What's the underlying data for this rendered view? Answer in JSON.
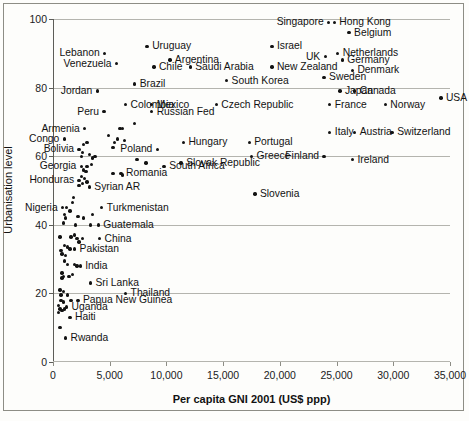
{
  "chart_data": {
    "type": "scatter",
    "title": "",
    "xlabel": "Per capita GNI 2001 (US$ ppp)",
    "ylabel": "Urbanisation level",
    "xlim": [
      0,
      35000
    ],
    "ylim": [
      0,
      100
    ],
    "xticks": [
      0,
      5000,
      10000,
      15000,
      20000,
      25000,
      30000,
      35000
    ],
    "xtick_labels": [
      "0",
      "5,000",
      "10,000",
      "15,000",
      "20,000",
      "25,000",
      "30,000",
      "35,000"
    ],
    "yticks": [
      0,
      20,
      40,
      60,
      80,
      100
    ],
    "ytick_labels": [
      "0",
      "20",
      "40",
      "60",
      "80",
      "100"
    ],
    "grid": "horizontal",
    "legend": "none",
    "marker_color": "#121212",
    "grid_color": "#b4b4ae",
    "labeled_points": [
      {
        "label": "Singapore",
        "x": 24300,
        "y": 99,
        "side": "left"
      },
      {
        "label": "Hong Kong",
        "x": 24800,
        "y": 99,
        "side": "right"
      },
      {
        "label": "Belgium",
        "x": 26100,
        "y": 96,
        "side": "right"
      },
      {
        "label": "Lebanon",
        "x": 4550,
        "y": 90,
        "side": "left"
      },
      {
        "label": "Uruguay",
        "x": 8300,
        "y": 92,
        "side": "right"
      },
      {
        "label": "Israel",
        "x": 19300,
        "y": 92,
        "side": "right"
      },
      {
        "label": "UK",
        "x": 24000,
        "y": 89,
        "side": "left"
      },
      {
        "label": "Netherlands",
        "x": 25100,
        "y": 90,
        "side": "right"
      },
      {
        "label": "Venezuela",
        "x": 5600,
        "y": 87,
        "side": "left"
      },
      {
        "label": "Chile",
        "x": 8900,
        "y": 86,
        "side": "right"
      },
      {
        "label": "Argentina",
        "x": 10300,
        "y": 88,
        "side": "right"
      },
      {
        "label": "Germany",
        "x": 25500,
        "y": 88,
        "side": "right"
      },
      {
        "label": "New Zealand",
        "x": 19300,
        "y": 86,
        "side": "right"
      },
      {
        "label": "Denmark",
        "x": 26400,
        "y": 85,
        "side": "right"
      },
      {
        "label": "Saudi Arabia",
        "x": 12100,
        "y": 86,
        "side": "right"
      },
      {
        "label": "South Korea",
        "x": 15300,
        "y": 82,
        "side": "right"
      },
      {
        "label": "Sweden",
        "x": 23900,
        "y": 83,
        "side": "right"
      },
      {
        "label": "Brazil",
        "x": 7200,
        "y": 81,
        "side": "right"
      },
      {
        "label": "Jordan",
        "x": 3900,
        "y": 79,
        "side": "left"
      },
      {
        "label": "Japan",
        "x": 25300,
        "y": 79,
        "side": "right"
      },
      {
        "label": "Canada",
        "x": 26600,
        "y": 79,
        "side": "right"
      },
      {
        "label": "USA",
        "x": 34200,
        "y": 77,
        "side": "right"
      },
      {
        "label": "Colombia",
        "x": 6400,
        "y": 75,
        "side": "right"
      },
      {
        "label": "Mexico",
        "x": 8700,
        "y": 75,
        "side": "right"
      },
      {
        "label": "Czech Republic",
        "x": 14400,
        "y": 75,
        "side": "right"
      },
      {
        "label": "France",
        "x": 24400,
        "y": 75,
        "side": "right"
      },
      {
        "label": "Norway",
        "x": 29300,
        "y": 75,
        "side": "right"
      },
      {
        "label": "Peru",
        "x": 4500,
        "y": 73,
        "side": "left"
      },
      {
        "label": "Russian Fed",
        "x": 8700,
        "y": 73,
        "side": "right"
      },
      {
        "label": "Armenia",
        "x": 2800,
        "y": 68,
        "side": "left"
      },
      {
        "label": "Italy",
        "x": 24400,
        "y": 67,
        "side": "right"
      },
      {
        "label": "Austria",
        "x": 26600,
        "y": 67,
        "side": "right"
      },
      {
        "label": "Switzerland",
        "x": 29900,
        "y": 67,
        "side": "right"
      },
      {
        "label": "Congo",
        "x": 1000,
        "y": 65,
        "side": "left"
      },
      {
        "label": "Poland",
        "x": 9200,
        "y": 62,
        "side": "left"
      },
      {
        "label": "Hungary",
        "x": 11500,
        "y": 64,
        "side": "right"
      },
      {
        "label": "Portugal",
        "x": 17300,
        "y": 64,
        "side": "right"
      },
      {
        "label": "Bolivia",
        "x": 2300,
        "y": 62,
        "side": "left"
      },
      {
        "label": "Greece",
        "x": 17500,
        "y": 60,
        "side": "right"
      },
      {
        "label": "Finland",
        "x": 23900,
        "y": 60,
        "side": "left"
      },
      {
        "label": "Ireland",
        "x": 26400,
        "y": 59,
        "side": "right"
      },
      {
        "label": "Georgia",
        "x": 2500,
        "y": 57,
        "side": "left"
      },
      {
        "label": "Slovak Republic",
        "x": 11300,
        "y": 58,
        "side": "right"
      },
      {
        "label": "South Africa",
        "x": 9800,
        "y": 57,
        "side": "right"
      },
      {
        "label": "Romania",
        "x": 6000,
        "y": 55,
        "side": "right"
      },
      {
        "label": "Honduras",
        "x": 2300,
        "y": 53,
        "side": "left"
      },
      {
        "label": "Syrian AR",
        "x": 3200,
        "y": 51,
        "side": "right"
      },
      {
        "label": "Slovenia",
        "x": 17800,
        "y": 49,
        "side": "right"
      },
      {
        "label": "Nigeria",
        "x": 850,
        "y": 45,
        "side": "left"
      },
      {
        "label": "Turkmenistan",
        "x": 4300,
        "y": 45,
        "side": "right"
      },
      {
        "label": "Guatemala",
        "x": 4000,
        "y": 40,
        "side": "right"
      },
      {
        "label": "China",
        "x": 4100,
        "y": 36,
        "side": "right"
      },
      {
        "label": "Pakistan",
        "x": 1900,
        "y": 33,
        "side": "right"
      },
      {
        "label": "India",
        "x": 2400,
        "y": 28,
        "side": "right"
      },
      {
        "label": "Sri Lanka",
        "x": 3300,
        "y": 23,
        "side": "right"
      },
      {
        "label": "Thailand",
        "x": 6400,
        "y": 20,
        "side": "right"
      },
      {
        "label": "Papua New Guinea",
        "x": 2200,
        "y": 18,
        "side": "right"
      },
      {
        "label": "Uganda",
        "x": 1200,
        "y": 16,
        "side": "right"
      },
      {
        "label": "Haiti",
        "x": 1500,
        "y": 13,
        "side": "right"
      },
      {
        "label": "Rwanda",
        "x": 1100,
        "y": 7,
        "side": "right"
      }
    ],
    "unlabeled_points": [
      {
        "x": 5400,
        "y": 64
      },
      {
        "x": 5900,
        "y": 68
      },
      {
        "x": 6100,
        "y": 68
      },
      {
        "x": 7200,
        "y": 69.5
      },
      {
        "x": 4900,
        "y": 66
      },
      {
        "x": 5700,
        "y": 65
      },
      {
        "x": 6300,
        "y": 64.5
      },
      {
        "x": 5300,
        "y": 62.5
      },
      {
        "x": 3000,
        "y": 64
      },
      {
        "x": 2700,
        "y": 63.5
      },
      {
        "x": 2600,
        "y": 61
      },
      {
        "x": 3200,
        "y": 60.5
      },
      {
        "x": 3700,
        "y": 60
      },
      {
        "x": 3500,
        "y": 59.5
      },
      {
        "x": 2500,
        "y": 60
      },
      {
        "x": 7400,
        "y": 59
      },
      {
        "x": 8200,
        "y": 58
      },
      {
        "x": 3400,
        "y": 57.5
      },
      {
        "x": 3000,
        "y": 57
      },
      {
        "x": 2700,
        "y": 56
      },
      {
        "x": 2900,
        "y": 55.5
      },
      {
        "x": 5300,
        "y": 55
      },
      {
        "x": 6100,
        "y": 54.5
      },
      {
        "x": 2500,
        "y": 54
      },
      {
        "x": 2800,
        "y": 53.5
      },
      {
        "x": 3000,
        "y": 52.5
      },
      {
        "x": 2600,
        "y": 52
      },
      {
        "x": 2300,
        "y": 51.5
      },
      {
        "x": 1800,
        "y": 48
      },
      {
        "x": 1700,
        "y": 46.5
      },
      {
        "x": 1200,
        "y": 45
      },
      {
        "x": 1500,
        "y": 44
      },
      {
        "x": 1000,
        "y": 43
      },
      {
        "x": 1100,
        "y": 42
      },
      {
        "x": 2200,
        "y": 42.5
      },
      {
        "x": 2700,
        "y": 42
      },
      {
        "x": 3500,
        "y": 43
      },
      {
        "x": 900,
        "y": 40.5
      },
      {
        "x": 2000,
        "y": 40
      },
      {
        "x": 3300,
        "y": 40
      },
      {
        "x": 600,
        "y": 36.5
      },
      {
        "x": 1600,
        "y": 36.5
      },
      {
        "x": 1900,
        "y": 37
      },
      {
        "x": 2100,
        "y": 36
      },
      {
        "x": 2600,
        "y": 36
      },
      {
        "x": 2300,
        "y": 35
      },
      {
        "x": 1000,
        "y": 34
      },
      {
        "x": 1300,
        "y": 33.5
      },
      {
        "x": 1500,
        "y": 33
      },
      {
        "x": 700,
        "y": 32.5
      },
      {
        "x": 800,
        "y": 31.5
      },
      {
        "x": 1100,
        "y": 31
      },
      {
        "x": 1000,
        "y": 29.5
      },
      {
        "x": 1300,
        "y": 28.5
      },
      {
        "x": 1900,
        "y": 28.5
      },
      {
        "x": 2100,
        "y": 28
      },
      {
        "x": 800,
        "y": 26
      },
      {
        "x": 900,
        "y": 25
      },
      {
        "x": 1400,
        "y": 25
      },
      {
        "x": 1700,
        "y": 25.5
      },
      {
        "x": 800,
        "y": 24.5
      },
      {
        "x": 600,
        "y": 21
      },
      {
        "x": 900,
        "y": 20.5
      },
      {
        "x": 700,
        "y": 19.5
      },
      {
        "x": 1300,
        "y": 19.5
      },
      {
        "x": 700,
        "y": 18
      },
      {
        "x": 900,
        "y": 17.5
      },
      {
        "x": 1600,
        "y": 18
      },
      {
        "x": 500,
        "y": 16.5
      },
      {
        "x": 600,
        "y": 15.5
      },
      {
        "x": 800,
        "y": 15
      },
      {
        "x": 1000,
        "y": 15.5
      },
      {
        "x": 500,
        "y": 14.5
      },
      {
        "x": 600,
        "y": 10
      }
    ]
  }
}
